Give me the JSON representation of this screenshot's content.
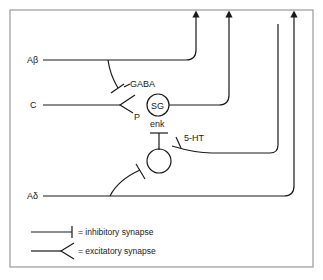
{
  "diagram": {
    "type": "neural-circuit (gate control)",
    "frame_color": "#9a9a9a",
    "stroke_color": "#1a1a1a",
    "inputs": [
      {
        "id": "abeta",
        "label": "Aβ"
      },
      {
        "id": "c",
        "label": "C"
      },
      {
        "id": "adelta",
        "label": "Aδ"
      }
    ],
    "nodes": [
      {
        "id": "sg",
        "label": "SG"
      },
      {
        "id": "interneuron",
        "label": ""
      }
    ],
    "labels": {
      "gaba": "GABA",
      "p": "P",
      "enk": "enk",
      "serotonin": "5-HT"
    },
    "legend": [
      {
        "symbol": "inhibitory",
        "text": "= inhibitory synapse"
      },
      {
        "symbol": "excitatory",
        "text": "= excitatory synapse"
      }
    ]
  }
}
